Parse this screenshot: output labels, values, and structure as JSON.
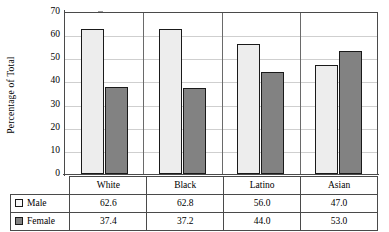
{
  "chart_data": {
    "type": "bar",
    "title": "",
    "xlabel": "",
    "ylabel": "Percentage of Total",
    "ylim": [
      0,
      70
    ],
    "ytick_step": 10,
    "yticks": [
      70,
      60,
      50,
      40,
      30,
      20,
      10,
      0
    ],
    "grid": true,
    "legend_position": "bottom-table",
    "categories": [
      "White",
      "Black",
      "Latino",
      "Asian"
    ],
    "series": [
      {
        "name": "Male",
        "color": "#ededed",
        "values": [
          62.6,
          62.8,
          56.0,
          47.0
        ]
      },
      {
        "name": "Female",
        "color": "#828282",
        "values": [
          37.4,
          37.2,
          44.0,
          53.0
        ]
      }
    ]
  },
  "table": {
    "row_labels": [
      "Male",
      "Female"
    ],
    "header": [
      "",
      "White",
      "Black",
      "Latino",
      "Asian"
    ],
    "rows": [
      {
        "label": "Male",
        "swatch": "male-swatch",
        "values": [
          "62.6",
          "62.8",
          "56.0",
          "47.0"
        ]
      },
      {
        "label": "Female",
        "swatch": "female-swatch",
        "values": [
          "37.4",
          "37.2",
          "44.0",
          "53.0"
        ]
      }
    ]
  }
}
